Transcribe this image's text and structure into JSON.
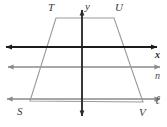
{
  "figure": {
    "background_color": "#ffffff",
    "width": 167,
    "height": 127,
    "colors": {
      "axis_dark": "#1c1c1c",
      "line_gray": "#8a8a8a",
      "shape_gray": "#9a9a9a",
      "label_dark": "#2b2b2b",
      "label_gray": "#4a4a4a"
    },
    "vertices": [
      {
        "name": "T",
        "label": "T",
        "x": 56,
        "y": 18,
        "label_x": 48,
        "label_y": 2
      },
      {
        "name": "U",
        "label": "U",
        "x": 114,
        "y": 18,
        "label_x": 115,
        "label_y": 2
      },
      {
        "name": "S",
        "label": "S",
        "x": 30,
        "y": 101,
        "label_x": 17,
        "label_y": 106
      },
      {
        "name": "V",
        "label": "V",
        "x": 143,
        "y": 102,
        "label_x": 139,
        "label_y": 107
      }
    ],
    "axes": [
      {
        "name": "y-axis",
        "label": "y",
        "orientation": "vertical",
        "position": 82,
        "label_x": 85,
        "label_y": 1
      },
      {
        "name": "x-axis",
        "label": "x",
        "orientation": "horizontal",
        "position": 47,
        "label_x": 155,
        "label_y": 50
      }
    ],
    "horizontal_lines": [
      {
        "name": "line-n",
        "label": "n",
        "y": 67,
        "label_x": 155,
        "label_y": 71
      },
      {
        "name": "line-l",
        "label": "ℓ",
        "y": 99,
        "label_x": 155,
        "label_y": 96
      }
    ],
    "shape": {
      "name": "trapezoid-STUV",
      "label": "STUV",
      "points": "56,18 114,18 143,102 30,101"
    }
  }
}
